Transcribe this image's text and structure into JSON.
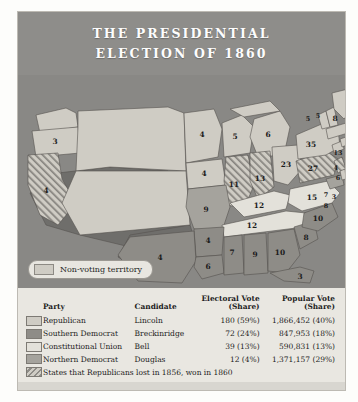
{
  "title": {
    "line1": "THE PRESIDENTIAL",
    "line2": "ELECTION OF 1860"
  },
  "map": {
    "legend_label": "Non-voting territory",
    "states": [
      {
        "name": "oregon",
        "votes": "3"
      },
      {
        "name": "california",
        "votes": "4"
      },
      {
        "name": "minnesota",
        "votes": "4"
      },
      {
        "name": "iowa",
        "votes": "4"
      },
      {
        "name": "wisconsin",
        "votes": "5"
      },
      {
        "name": "michigan",
        "votes": "6"
      },
      {
        "name": "illinois",
        "votes": "11"
      },
      {
        "name": "indiana",
        "votes": "13"
      },
      {
        "name": "ohio",
        "votes": "23"
      },
      {
        "name": "missouri",
        "votes": "9"
      },
      {
        "name": "kentucky",
        "votes": "12"
      },
      {
        "name": "tennessee",
        "votes": "12"
      },
      {
        "name": "arkansas",
        "votes": "4"
      },
      {
        "name": "texas",
        "votes": "4"
      },
      {
        "name": "louisiana",
        "votes": "6"
      },
      {
        "name": "mississippi",
        "votes": "7"
      },
      {
        "name": "alabama",
        "votes": "9"
      },
      {
        "name": "georgia",
        "votes": "10"
      },
      {
        "name": "florida",
        "votes": "3"
      },
      {
        "name": "south-carolina",
        "votes": "8"
      },
      {
        "name": "north-carolina",
        "votes": "10"
      },
      {
        "name": "virginia",
        "votes": "15"
      },
      {
        "name": "maryland",
        "votes": "8"
      },
      {
        "name": "delaware",
        "votes": "3"
      },
      {
        "name": "new-jersey",
        "votes": "7"
      },
      {
        "name": "pennsylvania",
        "votes": "27"
      },
      {
        "name": "new-york",
        "votes": "35"
      },
      {
        "name": "connecticut",
        "votes": "6"
      },
      {
        "name": "rhode-island",
        "votes": "4"
      },
      {
        "name": "massachusetts",
        "votes": "13"
      },
      {
        "name": "vermont",
        "votes": "5"
      },
      {
        "name": "new-hampshire",
        "votes": "5"
      },
      {
        "name": "maine",
        "votes": "8"
      },
      {
        "name": "nj-small",
        "votes": "3"
      }
    ]
  },
  "table": {
    "headers": {
      "party": "Party",
      "candidate": "Candidate",
      "electoral_l1": "Electoral Vote",
      "electoral_l2": "(Share)",
      "popular_l1": "Popular Vote",
      "popular_l2": "(Share)"
    },
    "rows": [
      {
        "party": "Republican",
        "candidate": "Lincoln",
        "electoral": "180 (59%)",
        "popular": "1,866,452 (40%)"
      },
      {
        "party": "Southern Democrat",
        "candidate": "Breckinridge",
        "electoral": "72 (24%)",
        "popular": "847,953 (18%)"
      },
      {
        "party": "Constitutional Union",
        "candidate": "Bell",
        "electoral": "39 (13%)",
        "popular": "590,831 (13%)"
      },
      {
        "party": "Northern Democrat",
        "candidate": "Douglas",
        "electoral": "12 (4%)",
        "popular": "1,371,157 (29%)"
      }
    ],
    "footnote": "States that Republicans lost in 1856, won in 1860"
  },
  "colors": {
    "republican": "#cfccc4",
    "southern_democrat": "#8e8c87",
    "constitutional_union": "#e3e1da",
    "northern_democrat": "#a5a39d",
    "territory": "#6f6e6b",
    "ocean": "#898885"
  }
}
